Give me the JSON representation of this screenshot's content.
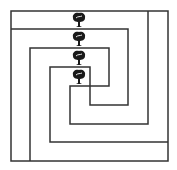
{
  "diagram": {
    "title": "Nested path maze with four trees",
    "line_color": "#333333",
    "background": "#ffffff",
    "icon_color": "#1a1a1a",
    "outer_frame": {
      "x1": 11,
      "y1": 11,
      "x2": 168,
      "y2": 161
    },
    "paths": [
      {
        "name": "spiral-a",
        "points": "11,29 128,29 128,105 90,105 90,67 50,67 50,142 168,142"
      },
      {
        "name": "spiral-b",
        "points": "30,161 30,48 109,48 109,86 70,86 70,124 148,124 148,11"
      }
    ],
    "trees": [
      {
        "label": "tree 1",
        "cx": 79,
        "y": 13
      },
      {
        "label": "tree 2",
        "cx": 79,
        "y": 32
      },
      {
        "label": "tree 3",
        "cx": 79,
        "y": 51
      },
      {
        "label": "tree 4",
        "cx": 79,
        "y": 70
      }
    ]
  }
}
